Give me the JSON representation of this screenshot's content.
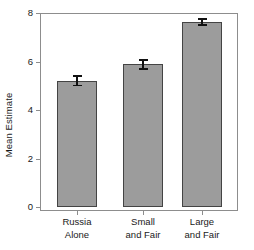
{
  "chart_data": {
    "type": "bar",
    "title": "",
    "xlabel": "",
    "ylabel": "Mean Estimate",
    "categories": [
      "Russia\nAlone",
      "Small\nand Fair",
      "Large\nand Fair"
    ],
    "category_lines": [
      [
        "Russia",
        "Alone"
      ],
      [
        "Small",
        "and Fair"
      ],
      [
        "Large",
        "and Fair"
      ]
    ],
    "values": [
      5.2,
      5.88,
      7.63
    ],
    "errors": [
      0.19,
      0.18,
      0.12
    ],
    "error_type": "standard error bars",
    "ylim": [
      0,
      8
    ],
    "yticks": [
      0,
      2,
      4,
      6,
      8
    ],
    "ytick_labels": [
      "0",
      "2",
      "4",
      "6",
      "8"
    ],
    "grid": false,
    "legend": null,
    "bar_color": "#9c9c9c",
    "bar_edge_color": "#444444",
    "error_color": "#111111",
    "axis_color": "#8d8d8d"
  },
  "axes": {
    "y_title": "Mean Estimate",
    "y_tick_labels": [
      "8",
      "6",
      "4",
      "2",
      "0"
    ],
    "x_tick_labels": [
      {
        "line1": "Russia",
        "line2": "Alone"
      },
      {
        "line1": "Small",
        "line2": "and Fair"
      },
      {
        "line1": "Large",
        "line2": "and Fair"
      }
    ]
  }
}
